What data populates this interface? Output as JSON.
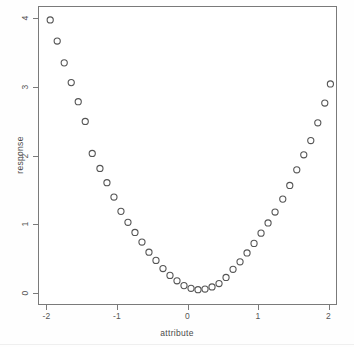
{
  "figure": {
    "background_color": "#ffffff",
    "frame_color": "#7a7a7a",
    "point_color": "#555555"
  },
  "chart_data": {
    "type": "scatter",
    "title": "",
    "xlabel": "attribute",
    "ylabel": "response",
    "xlim": [
      -2.12,
      2.12
    ],
    "ylim": [
      -0.18,
      4.18
    ],
    "xticks": [
      -2,
      -1,
      0,
      1,
      2
    ],
    "xticklabels": [
      "-2",
      "-1",
      "0",
      "1",
      "2"
    ],
    "yticks": [
      0,
      1,
      2,
      3,
      4
    ],
    "yticklabels": [
      "0",
      "1",
      "2",
      "3",
      "4"
    ],
    "grid": false,
    "legend": null,
    "marker": "open-circle",
    "marker_size": 3.1,
    "n_points": 41,
    "relationship": "y = x^2",
    "x": [
      -1.96,
      -1.86,
      -1.76,
      -1.66,
      -1.56,
      -1.46,
      -1.36,
      -1.25,
      -1.15,
      -1.05,
      -0.95,
      -0.85,
      -0.75,
      -0.65,
      -0.55,
      -0.45,
      -0.35,
      -0.25,
      -0.15,
      -0.05,
      0.05,
      0.15,
      0.25,
      0.35,
      0.45,
      0.55,
      0.65,
      0.75,
      0.85,
      0.95,
      1.05,
      1.15,
      1.25,
      1.36,
      1.46,
      1.56,
      1.66,
      1.76,
      1.86,
      1.96,
      2.04
    ],
    "y": [
      3.99,
      3.68,
      3.36,
      3.07,
      2.79,
      2.5,
      2.03,
      1.81,
      1.6,
      1.39,
      1.18,
      1.02,
      0.87,
      0.73,
      0.58,
      0.46,
      0.34,
      0.24,
      0.16,
      0.09,
      0.05,
      0.03,
      0.04,
      0.07,
      0.12,
      0.21,
      0.33,
      0.44,
      0.57,
      0.71,
      0.86,
      1.01,
      1.17,
      1.36,
      1.56,
      1.79,
      2.01,
      2.22,
      2.48,
      2.77,
      3.05
    ]
  }
}
